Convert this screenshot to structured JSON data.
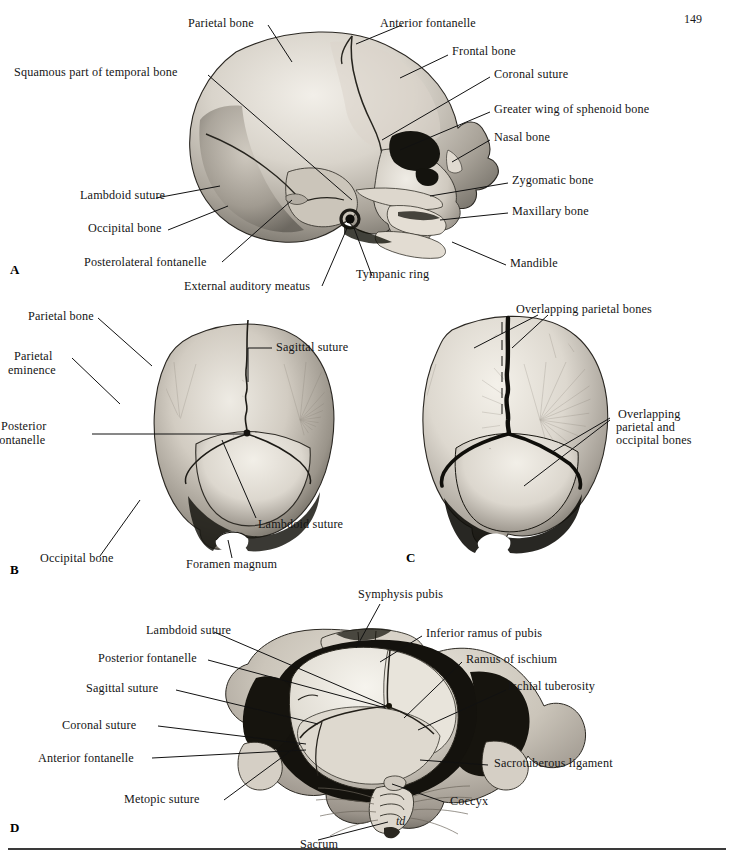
{
  "page": {
    "folio": "149",
    "signature": "td"
  },
  "panels": [
    {
      "letter": "A",
      "name": "lateral-view-fetal-skull",
      "labels": [
        {
          "id": "a-parietal-bone",
          "text": "Parietal bone"
        },
        {
          "id": "a-anterior-fontanelle",
          "text": "Anterior fontanelle"
        },
        {
          "id": "a-frontal-bone",
          "text": "Frontal bone"
        },
        {
          "id": "a-coronal-suture",
          "text": "Coronal suture"
        },
        {
          "id": "a-squamous-part-of-temporal-bone",
          "text": "Squamous part of temporal bone"
        },
        {
          "id": "a-greater-wing-of-sphenoid-bone",
          "text": "Greater wing of sphenoid bone"
        },
        {
          "id": "a-nasal-bone",
          "text": "Nasal bone"
        },
        {
          "id": "a-zygomatic-bone",
          "text": "Zygomatic bone"
        },
        {
          "id": "a-lambdoid-suture",
          "text": "Lambdoid suture"
        },
        {
          "id": "a-maxillary-bone",
          "text": "Maxillary bone"
        },
        {
          "id": "a-occipital-bone",
          "text": "Occipital bone"
        },
        {
          "id": "a-mandible",
          "text": "Mandible"
        },
        {
          "id": "a-posterolateral-fontanelle",
          "text": "Posterolateral fontanelle"
        },
        {
          "id": "a-tympanic-ring",
          "text": "Tympanic ring"
        },
        {
          "id": "a-external-auditory-meatus",
          "text": "External auditory meatus"
        }
      ]
    },
    {
      "letter": "B",
      "name": "posterior-view-fetal-skull",
      "labels": [
        {
          "id": "b-parietal-bone",
          "text": "Parietal bone"
        },
        {
          "id": "b-parietal-eminence-1",
          "text": "Parietal"
        },
        {
          "id": "b-parietal-eminence-2",
          "text": "eminence"
        },
        {
          "id": "b-sagittal-suture",
          "text": "Sagittal suture"
        },
        {
          "id": "b-posterior-fontanelle-1",
          "text": "Posterior"
        },
        {
          "id": "b-posterior-fontanelle-2",
          "text": "fontanelle"
        },
        {
          "id": "b-lambdoid-suture",
          "text": "Lambdoid suture"
        },
        {
          "id": "b-occipital-bone",
          "text": "Occipital bone"
        },
        {
          "id": "b-foramen-magnum",
          "text": "Foramen magnum"
        }
      ]
    },
    {
      "letter": "C",
      "name": "posterior-view-moulded-skull",
      "labels": [
        {
          "id": "c-overlapping-parietal-bones",
          "text": "Overlapping parietal bones"
        },
        {
          "id": "c-overlapping-1",
          "text": "Overlapping"
        },
        {
          "id": "c-overlapping-2",
          "text": "parietal and"
        },
        {
          "id": "c-overlapping-3",
          "text": "occipital bones"
        }
      ]
    },
    {
      "letter": "D",
      "name": "fetal-head-in-pelvis",
      "labels": [
        {
          "id": "d-symphysis-pubis",
          "text": "Symphysis pubis"
        },
        {
          "id": "d-lambdoid-suture",
          "text": "Lambdoid suture"
        },
        {
          "id": "d-inferior-ramus-of-pubis",
          "text": "Inferior ramus of pubis"
        },
        {
          "id": "d-posterior-fontanelle",
          "text": "Posterior fontanelle"
        },
        {
          "id": "d-ramus-of-ischium",
          "text": "Ramus of ischium"
        },
        {
          "id": "d-sagittal-suture",
          "text": "Sagittal suture"
        },
        {
          "id": "d-ischial-tuberosity",
          "text": "Ischial tuberosity"
        },
        {
          "id": "d-coronal-suture",
          "text": "Coronal suture"
        },
        {
          "id": "d-anterior-fontanelle",
          "text": "Anterior fontanelle"
        },
        {
          "id": "d-sacrotuberous-ligament",
          "text": "Sacrotuberous ligament"
        },
        {
          "id": "d-metopic-suture",
          "text": "Metopic suture"
        },
        {
          "id": "d-coccyx",
          "text": "Coccyx"
        },
        {
          "id": "d-sacrum",
          "text": "Sacrum"
        }
      ]
    }
  ]
}
